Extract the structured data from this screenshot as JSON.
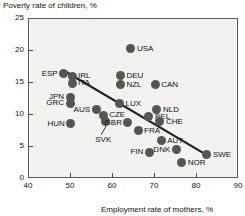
{
  "chart_data": {
    "type": "scatter",
    "title": "",
    "ylabel": "Poverty rate of children, %",
    "xlabel": "Employment rate of mothers, %",
    "xlim": [
      40,
      90
    ],
    "ylim": [
      0,
      25
    ],
    "xticks": [
      "40",
      "50",
      "60",
      "70",
      "80",
      "90"
    ],
    "yticks": [
      "25",
      "20",
      "15",
      "10",
      "5",
      "0"
    ],
    "grid": false,
    "legend": "none",
    "trendline": {
      "x0": 49.0,
      "y0": 16.6,
      "x1": 82.8,
      "y1": 3.5
    },
    "points": [
      {
        "label": "USA",
        "x": 64.5,
        "y": 20.2,
        "lpos": "right"
      },
      {
        "label": "ESP",
        "x": 48.5,
        "y": 16.3,
        "lpos": "left"
      },
      {
        "label": "IRL",
        "x": 50.5,
        "y": 15.9,
        "lpos": "right"
      },
      {
        "label": "ITA",
        "x": 50.5,
        "y": 14.8,
        "lpos": "right"
      },
      {
        "label": "DEU",
        "x": 62.0,
        "y": 16.0,
        "lpos": "right"
      },
      {
        "label": "NZL",
        "x": 62.0,
        "y": 14.6,
        "lpos": "right"
      },
      {
        "label": "CAN",
        "x": 70.3,
        "y": 14.6,
        "lpos": "right"
      },
      {
        "label": "JPN",
        "x": 50.0,
        "y": 12.6,
        "lpos": "left"
      },
      {
        "label": "GRC",
        "x": 50.0,
        "y": 11.7,
        "lpos": "left"
      },
      {
        "label": "LUX",
        "x": 61.8,
        "y": 11.6,
        "lpos": "right"
      },
      {
        "label": "NLD",
        "x": 70.7,
        "y": 10.7,
        "lpos": "right"
      },
      {
        "label": "AUS",
        "x": 56.2,
        "y": 10.7,
        "lpos": "left"
      },
      {
        "label": "BEL",
        "x": 68.8,
        "y": 9.6,
        "lpos": "right"
      },
      {
        "label": "CZE",
        "x": 57.9,
        "y": 9.8,
        "lpos": "right"
      },
      {
        "label": "SVK",
        "x": 58.4,
        "y": 8.8,
        "lpos": "leader"
      },
      {
        "label": "CHE",
        "x": 71.4,
        "y": 8.8,
        "lpos": "right"
      },
      {
        "label": "HUN",
        "x": 50.2,
        "y": 8.5,
        "lpos": "left"
      },
      {
        "label": "GBR",
        "x": 63.8,
        "y": 8.6,
        "lpos": "left"
      },
      {
        "label": "FRA",
        "x": 66.2,
        "y": 7.4,
        "lpos": "right"
      },
      {
        "label": "AUT",
        "x": 71.7,
        "y": 5.8,
        "lpos": "right"
      },
      {
        "label": "DNK",
        "x": 75.3,
        "y": 4.4,
        "lpos": "left"
      },
      {
        "label": "FIN",
        "x": 68.9,
        "y": 4.0,
        "lpos": "left"
      },
      {
        "label": "SWE",
        "x": 82.6,
        "y": 3.6,
        "lpos": "right"
      },
      {
        "label": "NOR",
        "x": 76.6,
        "y": 2.4,
        "lpos": "right"
      }
    ]
  }
}
